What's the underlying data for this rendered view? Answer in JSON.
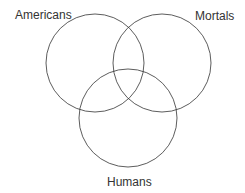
{
  "diagram": {
    "type": "venn",
    "sets": [
      {
        "label": "Americans",
        "cx": 95,
        "cy": 63,
        "r": 49
      },
      {
        "label": "Mortals",
        "cx": 162,
        "cy": 63,
        "r": 49
      },
      {
        "label": "Humans",
        "cx": 128,
        "cy": 118,
        "r": 49
      }
    ],
    "stroke_color": "#333333"
  }
}
